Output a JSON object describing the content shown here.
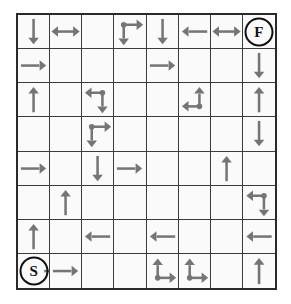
{
  "figure": {
    "kind": "grid-puzzle",
    "rows": 8,
    "cols": 8,
    "arrow_color": "#757575",
    "grid_line_color": "#3c3c3c",
    "border_color": "#2a2a2a",
    "background_color": "#fafafa",
    "page_background": "#ffffff"
  },
  "markers": {
    "start_label": "S",
    "finish_label": "F",
    "start_cell": {
      "row": 7,
      "col": 0
    },
    "finish_cell": {
      "row": 0,
      "col": 7
    }
  },
  "legend": {
    "arrow_down": "arrow-down-icon",
    "arrow_up": "arrow-up-icon",
    "arrow_left": "arrow-left-icon",
    "arrow_right": "arrow-right-icon",
    "arrow_left_right": "arrow-left-right-icon",
    "corner_down_right": "corner-down-right-icon",
    "corner_left_down": "corner-left-down-icon",
    "corner_left_up": "corner-left-up-icon",
    "corner_up_right": "corner-up-right-icon"
  },
  "grid": [
    [
      {
        "type": "down"
      },
      {
        "type": "left-right"
      },
      {
        "type": "empty"
      },
      {
        "type": "corner-down-right"
      },
      {
        "type": "down"
      },
      {
        "type": "left"
      },
      {
        "type": "left-right"
      },
      {
        "type": "finish",
        "label": "F"
      }
    ],
    [
      {
        "type": "right"
      },
      {
        "type": "empty"
      },
      {
        "type": "empty"
      },
      {
        "type": "empty"
      },
      {
        "type": "right"
      },
      {
        "type": "empty"
      },
      {
        "type": "empty"
      },
      {
        "type": "down"
      }
    ],
    [
      {
        "type": "up"
      },
      {
        "type": "empty"
      },
      {
        "type": "corner-left-down"
      },
      {
        "type": "empty"
      },
      {
        "type": "empty"
      },
      {
        "type": "corner-left-up"
      },
      {
        "type": "empty"
      },
      {
        "type": "up"
      }
    ],
    [
      {
        "type": "empty"
      },
      {
        "type": "empty"
      },
      {
        "type": "corner-down-right"
      },
      {
        "type": "empty"
      },
      {
        "type": "empty"
      },
      {
        "type": "empty"
      },
      {
        "type": "empty"
      },
      {
        "type": "down"
      }
    ],
    [
      {
        "type": "right"
      },
      {
        "type": "empty"
      },
      {
        "type": "down"
      },
      {
        "type": "right"
      },
      {
        "type": "empty"
      },
      {
        "type": "empty"
      },
      {
        "type": "up"
      },
      {
        "type": "empty"
      }
    ],
    [
      {
        "type": "empty"
      },
      {
        "type": "up"
      },
      {
        "type": "empty"
      },
      {
        "type": "empty"
      },
      {
        "type": "empty"
      },
      {
        "type": "empty"
      },
      {
        "type": "empty"
      },
      {
        "type": "corner-left-down"
      }
    ],
    [
      {
        "type": "up"
      },
      {
        "type": "empty"
      },
      {
        "type": "left"
      },
      {
        "type": "empty"
      },
      {
        "type": "left"
      },
      {
        "type": "empty"
      },
      {
        "type": "empty"
      },
      {
        "type": "left"
      }
    ],
    [
      {
        "type": "start",
        "label": "S"
      },
      {
        "type": "right"
      },
      {
        "type": "empty"
      },
      {
        "type": "empty"
      },
      {
        "type": "corner-up-right"
      },
      {
        "type": "corner-up-right"
      },
      {
        "type": "empty"
      },
      {
        "type": "up"
      }
    ]
  ]
}
